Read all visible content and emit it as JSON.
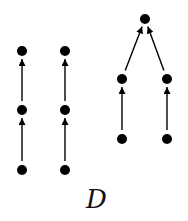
{
  "figure": {
    "label": "D",
    "node_color": "#000000",
    "edge_color": "#000000",
    "nodes": [
      {
        "id": "a1",
        "x": 22,
        "y": 51
      },
      {
        "id": "a2",
        "x": 22,
        "y": 110
      },
      {
        "id": "a3",
        "x": 22,
        "y": 170
      },
      {
        "id": "b1",
        "x": 65,
        "y": 51
      },
      {
        "id": "b2",
        "x": 65,
        "y": 110
      },
      {
        "id": "b3",
        "x": 65,
        "y": 170
      },
      {
        "id": "t",
        "x": 145,
        "y": 19
      },
      {
        "id": "l1",
        "x": 122,
        "y": 79
      },
      {
        "id": "l2",
        "x": 122,
        "y": 139
      },
      {
        "id": "r1",
        "x": 167,
        "y": 79
      },
      {
        "id": "r2",
        "x": 167,
        "y": 139
      }
    ],
    "edges": [
      {
        "from": "a3",
        "to": "a2"
      },
      {
        "from": "a2",
        "to": "a1"
      },
      {
        "from": "b3",
        "to": "b2"
      },
      {
        "from": "b2",
        "to": "b1"
      },
      {
        "from": "l2",
        "to": "l1"
      },
      {
        "from": "l1",
        "to": "t"
      },
      {
        "from": "r2",
        "to": "r1"
      },
      {
        "from": "r1",
        "to": "t"
      }
    ],
    "components": [
      {
        "name": "chain-left-1",
        "nodes": [
          "a3",
          "a2",
          "a1"
        ]
      },
      {
        "name": "chain-left-2",
        "nodes": [
          "b3",
          "b2",
          "b1"
        ]
      },
      {
        "name": "tree-right",
        "nodes": [
          "l2",
          "l1",
          "r2",
          "r1",
          "t"
        ]
      }
    ]
  }
}
